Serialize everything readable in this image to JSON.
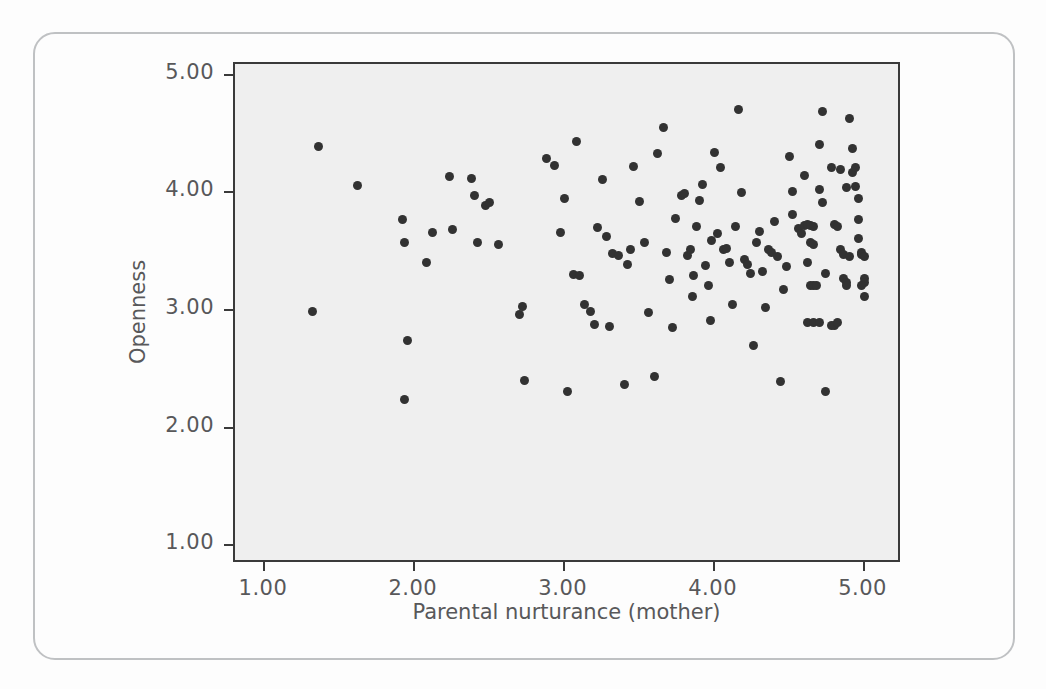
{
  "chart_data": {
    "type": "scatter",
    "title": "",
    "xlabel": "Parental nurturance (mother)",
    "ylabel": "Openness",
    "xlim": [
      0.8,
      5.25
    ],
    "ylim": [
      0.85,
      5.1
    ],
    "xticks": [
      "1.00",
      "2.00",
      "3.00",
      "4.00",
      "5.00"
    ],
    "xtick_values": [
      1,
      2,
      3,
      4,
      5
    ],
    "yticks": [
      "1.00",
      "2.00",
      "3.00",
      "4.00",
      "5.00"
    ],
    "ytick_values": [
      1,
      2,
      3,
      4,
      5
    ],
    "grid": false,
    "legend": null,
    "marker": {
      "shape": "circle",
      "color": "#323232",
      "size": 9
    },
    "plot_background": "#efefef",
    "frame_color": "#3a3a3a",
    "points": [
      [
        1.36,
        4.4
      ],
      [
        1.32,
        3.0
      ],
      [
        1.62,
        4.07
      ],
      [
        1.92,
        3.78
      ],
      [
        1.93,
        3.58
      ],
      [
        1.95,
        2.75
      ],
      [
        1.93,
        2.25
      ],
      [
        2.08,
        3.41
      ],
      [
        2.12,
        3.67
      ],
      [
        2.23,
        4.14
      ],
      [
        2.25,
        3.69
      ],
      [
        2.38,
        4.13
      ],
      [
        2.4,
        3.98
      ],
      [
        2.42,
        3.58
      ],
      [
        2.47,
        3.9
      ],
      [
        2.5,
        3.92
      ],
      [
        2.56,
        3.57
      ],
      [
        2.72,
        3.04
      ],
      [
        2.7,
        2.97
      ],
      [
        2.73,
        2.41
      ],
      [
        2.88,
        4.3
      ],
      [
        2.93,
        4.24
      ],
      [
        2.97,
        3.67
      ],
      [
        3.0,
        3.96
      ],
      [
        3.02,
        2.32
      ],
      [
        3.06,
        3.31
      ],
      [
        3.1,
        3.3
      ],
      [
        3.08,
        4.44
      ],
      [
        3.13,
        3.06
      ],
      [
        3.17,
        3.0
      ],
      [
        3.2,
        2.89
      ],
      [
        3.25,
        4.12
      ],
      [
        3.22,
        3.71
      ],
      [
        3.28,
        3.63
      ],
      [
        3.3,
        2.87
      ],
      [
        3.32,
        3.49
      ],
      [
        3.36,
        3.47
      ],
      [
        3.4,
        2.38
      ],
      [
        3.42,
        3.4
      ],
      [
        3.44,
        3.52
      ],
      [
        3.46,
        4.23
      ],
      [
        3.5,
        3.93
      ],
      [
        3.53,
        3.58
      ],
      [
        3.56,
        2.99
      ],
      [
        3.6,
        2.44
      ],
      [
        3.62,
        4.34
      ],
      [
        3.66,
        4.56
      ],
      [
        3.68,
        3.5
      ],
      [
        3.7,
        3.27
      ],
      [
        3.72,
        2.86
      ],
      [
        3.74,
        3.79
      ],
      [
        3.78,
        3.98
      ],
      [
        3.8,
        4.0
      ],
      [
        3.82,
        3.47
      ],
      [
        3.84,
        3.52
      ],
      [
        3.85,
        3.12
      ],
      [
        3.86,
        3.3
      ],
      [
        3.88,
        3.72
      ],
      [
        3.9,
        3.94
      ],
      [
        3.92,
        4.08
      ],
      [
        3.94,
        3.39
      ],
      [
        3.96,
        3.22
      ],
      [
        3.97,
        2.92
      ],
      [
        3.98,
        3.6
      ],
      [
        4.0,
        4.35
      ],
      [
        4.02,
        3.66
      ],
      [
        4.04,
        4.22
      ],
      [
        4.06,
        3.52
      ],
      [
        4.08,
        3.53
      ],
      [
        4.1,
        3.41
      ],
      [
        4.12,
        3.06
      ],
      [
        4.14,
        3.72
      ],
      [
        4.16,
        4.71
      ],
      [
        4.18,
        4.01
      ],
      [
        4.2,
        3.44
      ],
      [
        4.22,
        3.4
      ],
      [
        4.24,
        3.32
      ],
      [
        4.26,
        2.71
      ],
      [
        4.28,
        3.58
      ],
      [
        4.3,
        3.68
      ],
      [
        4.32,
        3.34
      ],
      [
        4.34,
        3.03
      ],
      [
        4.36,
        3.52
      ],
      [
        4.38,
        3.5
      ],
      [
        4.4,
        3.76
      ],
      [
        4.42,
        3.46
      ],
      [
        4.44,
        2.4
      ],
      [
        4.5,
        4.31
      ],
      [
        4.52,
        3.82
      ],
      [
        4.56,
        3.7
      ],
      [
        4.58,
        3.66
      ],
      [
        4.6,
        3.73
      ],
      [
        4.62,
        3.74
      ],
      [
        4.64,
        3.73
      ],
      [
        4.66,
        3.72
      ],
      [
        4.64,
        3.58
      ],
      [
        4.66,
        3.57
      ],
      [
        4.62,
        3.41
      ],
      [
        4.64,
        3.22
      ],
      [
        4.66,
        3.22
      ],
      [
        4.68,
        3.22
      ],
      [
        4.62,
        2.9
      ],
      [
        4.66,
        2.9
      ],
      [
        4.7,
        2.9
      ],
      [
        4.7,
        4.03
      ],
      [
        4.72,
        4.7
      ],
      [
        4.7,
        4.42
      ],
      [
        4.72,
        3.92
      ],
      [
        4.74,
        3.32
      ],
      [
        4.74,
        2.32
      ],
      [
        4.78,
        4.22
      ],
      [
        4.8,
        3.74
      ],
      [
        4.82,
        3.72
      ],
      [
        4.84,
        3.52
      ],
      [
        4.86,
        3.28
      ],
      [
        4.88,
        3.24
      ],
      [
        4.9,
        4.64
      ],
      [
        4.92,
        4.38
      ],
      [
        4.92,
        4.18
      ],
      [
        4.94,
        4.22
      ],
      [
        4.94,
        4.06
      ],
      [
        4.96,
        3.96
      ],
      [
        4.96,
        3.78
      ],
      [
        4.96,
        3.62
      ],
      [
        4.98,
        3.5
      ],
      [
        4.98,
        3.48
      ],
      [
        5.0,
        3.46
      ],
      [
        5.0,
        3.28
      ],
      [
        5.0,
        3.24
      ],
      [
        4.98,
        3.22
      ],
      [
        5.0,
        3.12
      ],
      [
        4.88,
        4.05
      ],
      [
        4.84,
        4.2
      ],
      [
        4.86,
        3.48
      ],
      [
        4.9,
        3.46
      ],
      [
        4.88,
        3.22
      ],
      [
        4.8,
        2.88
      ],
      [
        4.78,
        2.88
      ],
      [
        4.82,
        2.9
      ],
      [
        4.6,
        4.15
      ],
      [
        4.52,
        4.02
      ],
      [
        4.48,
        3.38
      ],
      [
        4.46,
        3.18
      ]
    ]
  }
}
